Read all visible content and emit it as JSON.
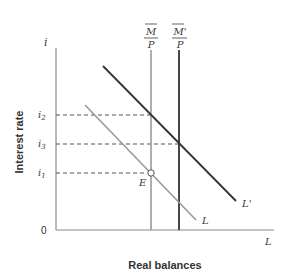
{
  "diagram": {
    "axes": {
      "y_label": "Interest rate",
      "y_symbol": "i",
      "x_label": "Real balances",
      "x_symbol": "L",
      "origin_label": "0"
    },
    "supply_lines": [
      {
        "id": "M_over_P",
        "numerator": "M",
        "denominator": "P",
        "color": "#9a9a9a"
      },
      {
        "id": "Mprime_over_P",
        "numerator": "M'",
        "denominator": "P",
        "color": "#333333"
      }
    ],
    "demand_curves": [
      {
        "id": "L",
        "label": "L",
        "color": "#9a9a9a"
      },
      {
        "id": "L_prime",
        "label": "L'",
        "color": "#333333"
      }
    ],
    "interest_levels": [
      {
        "id": "i2",
        "base": "i",
        "sub": "2"
      },
      {
        "id": "i3",
        "base": "i",
        "sub": "3"
      },
      {
        "id": "i1",
        "base": "i",
        "sub": "1"
      }
    ],
    "equilibrium_point": {
      "label": "E"
    }
  }
}
